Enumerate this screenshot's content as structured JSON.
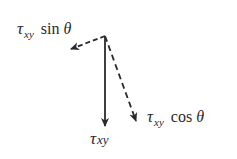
{
  "diagram": {
    "type": "vector-decomposition",
    "colors": {
      "stroke": "#2a2a2a",
      "background": "#ffffff"
    },
    "origin": {
      "x": 105,
      "y": 36
    },
    "vectors": [
      {
        "id": "tau_xy",
        "style": "solid",
        "end": {
          "x": 105,
          "y": 127
        }
      },
      {
        "id": "tau_xy_cos",
        "style": "dashed",
        "end": {
          "x": 137,
          "y": 122
        }
      },
      {
        "id": "tau_xy_sin",
        "style": "dashed",
        "end": {
          "x": 70,
          "y": 49
        }
      }
    ],
    "labels": {
      "sin_component": {
        "symbol": "τ",
        "subscript": "xy",
        "function": "sin",
        "angle": "θ"
      },
      "cos_component": {
        "symbol": "τ",
        "subscript": "xy",
        "function": "cos",
        "angle": "θ"
      },
      "resultant": {
        "symbol": "τ",
        "subscript": "xy"
      }
    }
  }
}
